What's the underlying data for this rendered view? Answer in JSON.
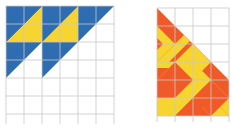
{
  "colors": {
    "blue": "#2f6db3",
    "yellow": "#f7d531",
    "orange": "#f05a28",
    "grid": "#c8c8c8",
    "background": "#ffffff"
  },
  "left_figure": {
    "label": "blue-yellow-triangle-pattern",
    "grid": {
      "cols": 6,
      "rows": 6,
      "cell": 18,
      "x": 6,
      "y": 6
    }
  },
  "right_figure": {
    "label": "orange-yellow-chevron-triangle",
    "grid": {
      "cols": 6,
      "rows": 6,
      "cell": 18,
      "x": 157,
      "y": 8
    }
  }
}
